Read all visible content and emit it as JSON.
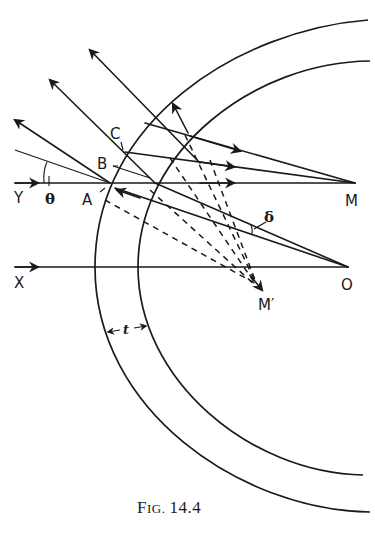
{
  "figure": {
    "caption_prefix_big": "F",
    "caption_prefix_small": "IG.",
    "caption_number": "14.4",
    "labels": {
      "Y": "Y",
      "X": "X",
      "A": "A",
      "B": "B",
      "C": "C",
      "M": "M",
      "M_prime": "M′",
      "O": "O",
      "theta": "θ",
      "delta": "δ",
      "t": "t"
    },
    "elements": {
      "surfaces": [
        "outer-arc",
        "inner-arc"
      ],
      "axes": [
        "Y-axis-ray",
        "X-axis-ray"
      ],
      "points": [
        "A",
        "B",
        "C",
        "M",
        "M′",
        "O"
      ],
      "angles": [
        "θ",
        "δ"
      ],
      "thickness": "t"
    }
  },
  "colors": {
    "ink": "#1a1a1a",
    "paper": "#ffffff"
  }
}
